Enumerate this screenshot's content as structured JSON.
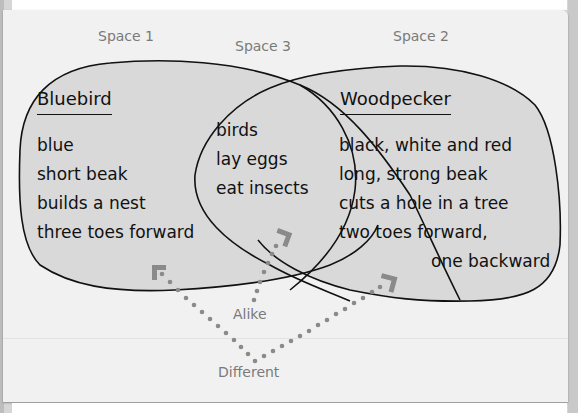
{
  "diagram": {
    "type": "venn",
    "space_labels": {
      "space1": "Space 1",
      "space2": "Space 2",
      "space3": "Space 3"
    },
    "left_set": {
      "title": "Bluebird",
      "items": [
        "blue",
        "short beak",
        "builds a nest",
        "three toes forward"
      ]
    },
    "overlap": {
      "items": [
        "birds",
        "lay eggs",
        "eat insects"
      ]
    },
    "right_set": {
      "title": "Woodpecker",
      "items": [
        "black, white and red",
        "long, strong beak",
        "cuts a hole in a tree",
        "two toes forward,",
        "one backward"
      ]
    },
    "callouts": {
      "alike": "Alike",
      "different": "Different"
    },
    "colors": {
      "set_fill": "#d9d9d9",
      "outline": "#111111",
      "label_gray": "#7a7a7a",
      "dots": "#8a8a8a",
      "card": "#f1f1f1"
    }
  }
}
